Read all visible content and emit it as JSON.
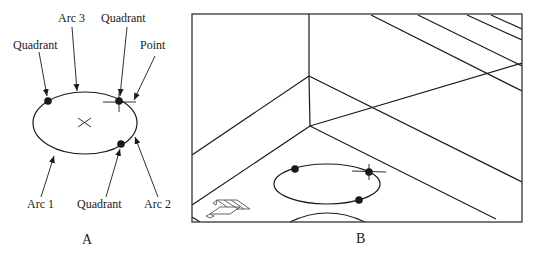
{
  "panel_a": {
    "caption": "A",
    "labels": {
      "arc3": "Arc 3",
      "quadrant_top": "Quadrant",
      "quadrant_left": "Quadrant",
      "point": "Point",
      "arc1": "Arc 1",
      "quadrant_bottom": "Quadrant",
      "arc2": "Arc 2"
    }
  },
  "panel_b": {
    "caption": "B",
    "ucs_icon": "ucs-icon"
  },
  "colors": {
    "stroke": "#1a1a1a",
    "background": "#ffffff"
  }
}
